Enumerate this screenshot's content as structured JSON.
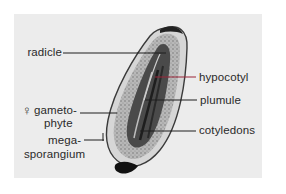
{
  "figure": {
    "background_color": "#ececec",
    "labels": {
      "radicle": "radicle",
      "hypocotyl": "hypocotyl",
      "gametophyte_line1": "gameto-",
      "gametophyte_line2": "phyte",
      "female_symbol": "♀",
      "megasporangium_line1": "mega-",
      "megasporangium_line2": "sporangium",
      "plumule": "plumule",
      "cotyledons": "cotyledons"
    },
    "leader_colors": {
      "default": "#1e1e1e",
      "hypocotyl": "#9a2438"
    }
  }
}
